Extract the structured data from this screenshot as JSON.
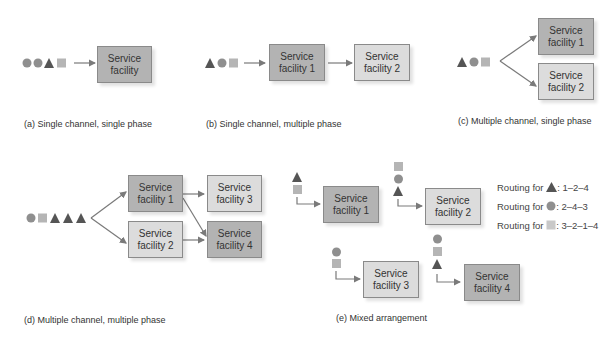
{
  "colors": {
    "dark_box": "#b3b3b3",
    "light_box": "#dcdcdc",
    "shape_circle": "#8f8f8f",
    "shape_triangle": "#555555",
    "shape_square": "#b5b5b5",
    "arrow": "#7a7a7a"
  },
  "panels": {
    "a": {
      "caption": "(a) Single channel, single phase",
      "queue": [
        "circle",
        "circle",
        "triangle",
        "square"
      ],
      "facilities": [
        {
          "label1": "Service",
          "label2": "facility"
        }
      ]
    },
    "b": {
      "caption": "(b) Single channel, multiple phase",
      "queue": [
        "triangle",
        "circle",
        "square"
      ],
      "facilities": [
        {
          "label1": "Service",
          "label2": "facility 1"
        },
        {
          "label1": "Service",
          "label2": "facility 2"
        }
      ]
    },
    "c": {
      "caption": "(c) Multiple channel, single phase",
      "queue": [
        "triangle",
        "circle",
        "square"
      ],
      "facilities": [
        {
          "label1": "Service",
          "label2": "facility 1"
        },
        {
          "label1": "Service",
          "label2": "facility 2"
        }
      ]
    },
    "d": {
      "caption": "(d) Multiple channel, multiple phase",
      "queue": [
        "circle",
        "square",
        "triangle",
        "triangle",
        "triangle"
      ],
      "facilities": [
        {
          "label1": "Service",
          "label2": "facility 1"
        },
        {
          "label1": "Service",
          "label2": "facility 2"
        },
        {
          "label1": "Service",
          "label2": "facility 3"
        },
        {
          "label1": "Service",
          "label2": "facility 4"
        }
      ]
    },
    "e": {
      "caption": "(e) Mixed arrangement",
      "facilities": [
        {
          "label1": "Service",
          "label2": "facility 1"
        },
        {
          "label1": "Service",
          "label2": "facility 2"
        },
        {
          "label1": "Service",
          "label2": "facility 3"
        },
        {
          "label1": "Service",
          "label2": "facility 4"
        }
      ],
      "routing": [
        {
          "prefix": "Routing for",
          "shape": "triangle",
          "route": ": 1–2–4"
        },
        {
          "prefix": "Routing for",
          "shape": "circle",
          "route": ": 2–4–3"
        },
        {
          "prefix": "Routing for",
          "shape": "square",
          "route": ": 3–2–1–4"
        }
      ]
    }
  }
}
